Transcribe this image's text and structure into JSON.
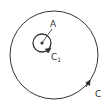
{
  "diagram": {
    "outer_circle": {
      "label": "C",
      "cx": 54,
      "cy": 55,
      "r": 44,
      "orientation": "counterclockwise"
    },
    "inner_circle": {
      "label": "C",
      "subscript": "1",
      "cx": 42,
      "cy": 43,
      "r": 9,
      "orientation": "counterclockwise"
    },
    "point": {
      "label": "A",
      "x": 42,
      "y": 43
    },
    "stroke_color": "#333333"
  }
}
